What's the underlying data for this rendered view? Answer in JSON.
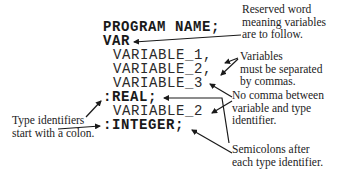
{
  "code_lines": {
    "program": "PROGRAM NAME;",
    "var": "VAR",
    "variable_1": "VARIABLE_1,",
    "variable_2a": "VARIABLE_2,",
    "variable_3": "VARIABLE_3",
    "real": ":REAL;",
    "variable_2b": "VARIABLE_2",
    "integer": ":INTEGER;"
  },
  "annotations": {
    "reserved_word": "Reserved word\nmeaning variables\nare to follow.",
    "separated_by_commas": "Variables\nmust be separated\nby commas.",
    "no_comma": "No comma between\nvariable and type\nidentifier.",
    "type_identifiers": "Type identifiers\nstart with a colon.",
    "semicolons": "Semicolons after\neach type identifier."
  },
  "colors": {
    "ink": "#1a1a1a",
    "background": "#ffffff"
  }
}
